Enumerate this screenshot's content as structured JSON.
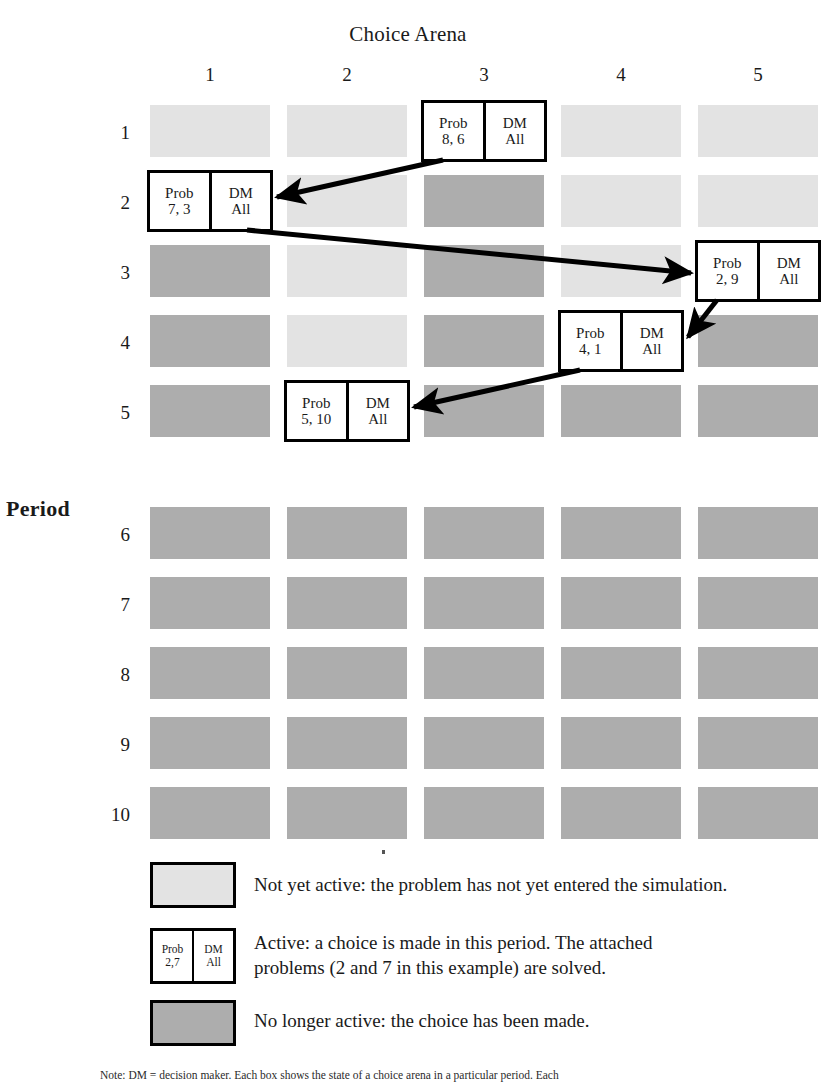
{
  "title": "Choice Arena",
  "axis": {
    "y_label": "Period",
    "columns": [
      "1",
      "2",
      "3",
      "4",
      "5"
    ],
    "rows": [
      "1",
      "2",
      "3",
      "4",
      "5",
      "6",
      "7",
      "8",
      "9",
      "10"
    ]
  },
  "colors": {
    "pending": "#e3e3e3",
    "done": "#adadad",
    "active_fill": "#ffffff",
    "border": "#000000",
    "arrow": "#000000"
  },
  "legend": [
    {
      "state": "pending",
      "swatch": "light-gray-square",
      "text": "Not yet active: the problem has not yet entered the simulation."
    },
    {
      "state": "active",
      "swatch": "active-box",
      "box": {
        "left_top": "Prob",
        "left_bottom": "2,7",
        "right_top": "DM",
        "right_bottom": "All"
      },
      "text_line1": "Active: a choice is made in this period. The attached",
      "text_line2": "problems (2 and 7 in this example) are solved."
    },
    {
      "state": "done",
      "swatch": "dark-gray-square",
      "text": "No longer active: the choice has been made."
    }
  ],
  "note": "Note: DM = decision maker. Each box shows the state of a choice arena in a particular period. Each",
  "chart_data": {
    "type": "heatmap",
    "title": "Choice Arena",
    "xlabel": "Choice Arena",
    "ylabel": "Period",
    "categories": [
      "1",
      "2",
      "3",
      "4",
      "5"
    ],
    "rows": [
      "1",
      "2",
      "3",
      "4",
      "5",
      "6",
      "7",
      "8",
      "9",
      "10"
    ],
    "states": [
      [
        "pending",
        "pending",
        "active",
        "pending",
        "pending"
      ],
      [
        "active",
        "pending",
        "done",
        "pending",
        "pending"
      ],
      [
        "done",
        "pending",
        "done",
        "pending",
        "active"
      ],
      [
        "done",
        "pending",
        "done",
        "active",
        "done"
      ],
      [
        "done",
        "active",
        "done",
        "done",
        "done"
      ],
      [
        "done",
        "done",
        "done",
        "done",
        "done"
      ],
      [
        "done",
        "done",
        "done",
        "done",
        "done"
      ],
      [
        "done",
        "done",
        "done",
        "done",
        "done"
      ],
      [
        "done",
        "done",
        "done",
        "done",
        "done"
      ],
      [
        "done",
        "done",
        "done",
        "done",
        "done"
      ]
    ],
    "active_cells": [
      {
        "period": 1,
        "arena": 3,
        "prob_label": "Prob",
        "prob_value": "8, 6",
        "dm_label": "DM",
        "dm_value": "All"
      },
      {
        "period": 2,
        "arena": 1,
        "prob_label": "Prob",
        "prob_value": "7, 3",
        "dm_label": "DM",
        "dm_value": "All"
      },
      {
        "period": 3,
        "arena": 5,
        "prob_label": "Prob",
        "prob_value": "2, 9",
        "dm_label": "DM",
        "dm_value": "All"
      },
      {
        "period": 4,
        "arena": 4,
        "prob_label": "Prob",
        "prob_value": "4, 1",
        "dm_label": "DM",
        "dm_value": "All"
      },
      {
        "period": 5,
        "arena": 2,
        "prob_label": "Prob",
        "prob_value": "5, 10",
        "dm_label": "DM",
        "dm_value": "All"
      }
    ],
    "arrows": [
      {
        "from": {
          "period": 1,
          "arena": 3
        },
        "to": {
          "period": 2,
          "arena": 1
        }
      },
      {
        "from": {
          "period": 2,
          "arena": 1
        },
        "to": {
          "period": 3,
          "arena": 5
        }
      },
      {
        "from": {
          "period": 3,
          "arena": 5
        },
        "to": {
          "period": 4,
          "arena": 4
        }
      },
      {
        "from": {
          "period": 4,
          "arena": 4
        },
        "to": {
          "period": 5,
          "arena": 2
        }
      }
    ],
    "legend_position": "bottom",
    "grid": false
  }
}
